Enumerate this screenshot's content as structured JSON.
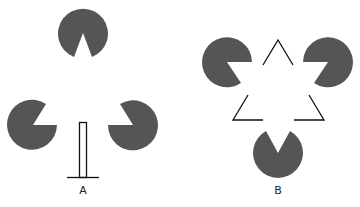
{
  "figure": {
    "colors": {
      "pacman": "#555555",
      "line": "#111111",
      "background": "#ffffff"
    },
    "panels": [
      {
        "label": "A",
        "description": "Three pac-man discs surrounding a vertical bar on a base line"
      },
      {
        "label": "B",
        "description": "Kanizsa triangle: three pac-man discs and outline triangle corners"
      }
    ]
  }
}
